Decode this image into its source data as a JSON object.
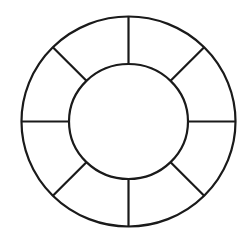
{
  "diagram": {
    "type": "segmented-ring",
    "segments": 8,
    "stroke_color": "#1a1a1a",
    "background": "#ffffff",
    "center": {
      "x": 128.5,
      "y": 121.5
    },
    "outer_radius": {
      "rx": 107,
      "ry": 105
    },
    "inner_radius": {
      "rx": 59.5,
      "ry": 57.5
    },
    "spoke_angles_deg": [
      0,
      45,
      90,
      135,
      180,
      225,
      270,
      315
    ]
  }
}
